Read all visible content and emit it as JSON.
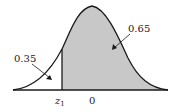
{
  "diagram": {
    "type": "normal-distribution-area",
    "left_area_label": "0.35",
    "right_area_label": "0.65",
    "z_label": "z",
    "z_subscript": "1",
    "mean_label": "0",
    "colors": {
      "shaded": "#c8c8c8",
      "curve": "#1a1a1a",
      "background": "#ffffff"
    }
  }
}
